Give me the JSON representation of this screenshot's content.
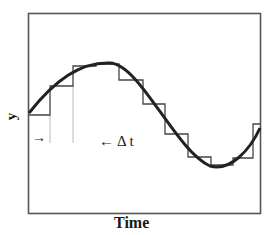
{
  "diagram": {
    "title": "",
    "x_axis_label": "Time",
    "y_axis_label": "y",
    "delta_label": "Δ t",
    "arrow_right_glyph": "→",
    "arrow_left_glyph": "←",
    "colors": {
      "frame": "#555555",
      "curve": "#222222",
      "steps": "#444444",
      "guides": "#bbbbbb"
    }
  }
}
